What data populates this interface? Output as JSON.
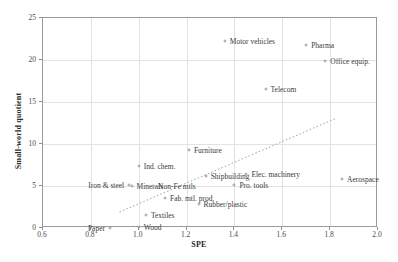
{
  "chart_data": {
    "type": "scatter",
    "title": "",
    "xlabel": "SPE",
    "ylabel": "Small-world quotient",
    "xlim": [
      0.6,
      2.0
    ],
    "ylim": [
      0,
      25
    ],
    "xticks": [
      "0.6",
      "0.8",
      "1.0",
      "1.2",
      "1.4",
      "1.6",
      "1.8",
      "2.0"
    ],
    "xtick_values": [
      0.6,
      0.8,
      1.0,
      1.2,
      1.4,
      1.6,
      1.8,
      2.0
    ],
    "yticks": [
      "0",
      "5",
      "10",
      "15",
      "20",
      "25"
    ],
    "ytick_values": [
      0,
      5,
      10,
      15,
      20,
      25
    ],
    "grid": true,
    "legend": "none",
    "trendline": {
      "present": true,
      "style": "dotted",
      "x0": 0.92,
      "y0": 1.9,
      "x1": 1.82,
      "y1": 13.0
    },
    "points": [
      {
        "label": "Motor vehicles",
        "x": 1.36,
        "y": 22.3,
        "label_side": "right"
      },
      {
        "label": "Pharma",
        "x": 1.7,
        "y": 21.8,
        "label_side": "right"
      },
      {
        "label": "Office equip.",
        "x": 1.78,
        "y": 19.9,
        "label_side": "right"
      },
      {
        "label": "Telecom",
        "x": 1.53,
        "y": 16.6,
        "label_side": "right"
      },
      {
        "label": "Furniture",
        "x": 1.21,
        "y": 9.3,
        "label_side": "right"
      },
      {
        "label": "Ind. chem.",
        "x": 1.0,
        "y": 7.4,
        "label_side": "right"
      },
      {
        "label": "Elec. machinery",
        "x": 1.45,
        "y": 6.4,
        "label_side": "right"
      },
      {
        "label": "Shipbuilding",
        "x": 1.28,
        "y": 6.2,
        "label_side": "right"
      },
      {
        "label": "Aerospace",
        "x": 1.85,
        "y": 5.8,
        "label_side": "right"
      },
      {
        "label": "Iron & steel",
        "x": 0.96,
        "y": 5.1,
        "label_side": "left"
      },
      {
        "label": "Minerals",
        "x": 0.97,
        "y": 5.0,
        "label_side": "right"
      },
      {
        "label": "Non-Fe mtls",
        "x": 1.06,
        "y": 5.0,
        "label_side": "right"
      },
      {
        "label": "Pro. tools",
        "x": 1.4,
        "y": 5.1,
        "label_side": "right"
      },
      {
        "label": "Fab. mtl. prod.",
        "x": 1.11,
        "y": 3.6,
        "label_side": "right"
      },
      {
        "label": "Rubber/plastic",
        "x": 1.25,
        "y": 2.8,
        "label_side": "right"
      },
      {
        "label": "Textiles",
        "x": 1.03,
        "y": 1.5,
        "label_side": "right"
      },
      {
        "label": "Wood",
        "x": 1.0,
        "y": 0.1,
        "label_side": "right"
      },
      {
        "label": "Paper",
        "x": 0.88,
        "y": 0.05,
        "label_side": "left"
      }
    ],
    "colors": {
      "marker_edge": "#9b9b9b",
      "grid": "#e2e2e2",
      "frame": "#9a9a9a",
      "trend": "#a0a0a0"
    }
  }
}
